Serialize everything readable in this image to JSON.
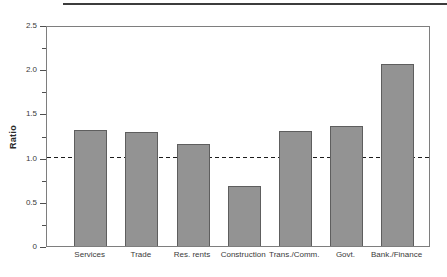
{
  "chart_data": {
    "type": "bar",
    "title": "",
    "xlabel": "",
    "ylabel": "Ratio",
    "categories": [
      "Services",
      "Trade",
      "Res. rents",
      "Construction",
      "Trans./Comm.",
      "Govt.",
      "Bank./Finance"
    ],
    "values": [
      1.33,
      1.3,
      1.16,
      0.69,
      1.31,
      1.37,
      2.08
    ],
    "ylim": [
      0,
      2.5
    ],
    "yticks": [
      0,
      0.5,
      1,
      1.5,
      2,
      2.5
    ],
    "ytick_labels": [
      "0",
      "0.5",
      "1.0",
      "1.5",
      "2.0",
      "2.5"
    ],
    "minor_tick_step": 0.25,
    "grid": false,
    "legend": null,
    "reference_line": {
      "y": 1.0,
      "style": "dashed",
      "color": "#1c1c1c"
    },
    "bar_fill": "#939393",
    "bar_border": "#5e5e5e",
    "frame_color": "#7e7e7e"
  }
}
